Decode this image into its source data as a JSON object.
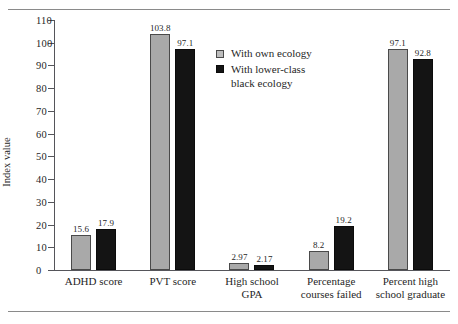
{
  "chart_data": {
    "type": "bar",
    "title": "",
    "xlabel": "",
    "ylabel": "Index value",
    "ylim": [
      0,
      110
    ],
    "ytick_step": 10,
    "yticks": [
      0,
      10,
      20,
      30,
      40,
      50,
      60,
      70,
      80,
      90,
      100,
      110
    ],
    "grid": false,
    "legend_position": "inside-top-center",
    "categories": [
      "ADHD score",
      "PVT score",
      "High school\nGPA",
      "Percentage\ncourses failed",
      "Percent high\nschool graduate"
    ],
    "series": [
      {
        "name": "With own ecology",
        "color": "#a9a9a9",
        "values": [
          15.6,
          103.8,
          2.97,
          8.2,
          97.1
        ],
        "labels": [
          "15.6",
          "103.8",
          "2.97",
          "8.2",
          "97.1"
        ]
      },
      {
        "name": "With lower-class black ecology",
        "color": "#141414",
        "values": [
          17.9,
          97.1,
          2.17,
          19.2,
          92.8
        ],
        "labels": [
          "17.9",
          "97.1",
          "2.17",
          "19.2",
          "92.8"
        ]
      }
    ],
    "legend": [
      {
        "label": "With own ecology",
        "swatch": "light-gray"
      },
      {
        "label": "With lower-class\nblack ecology",
        "swatch": "black"
      }
    ]
  },
  "colors": {
    "series_own": "#a9a9a9",
    "series_lower": "#141414",
    "axis": "#55555a",
    "rule": "#8a8a8a",
    "text": "#1f1f1f",
    "background": "#ffffff"
  }
}
